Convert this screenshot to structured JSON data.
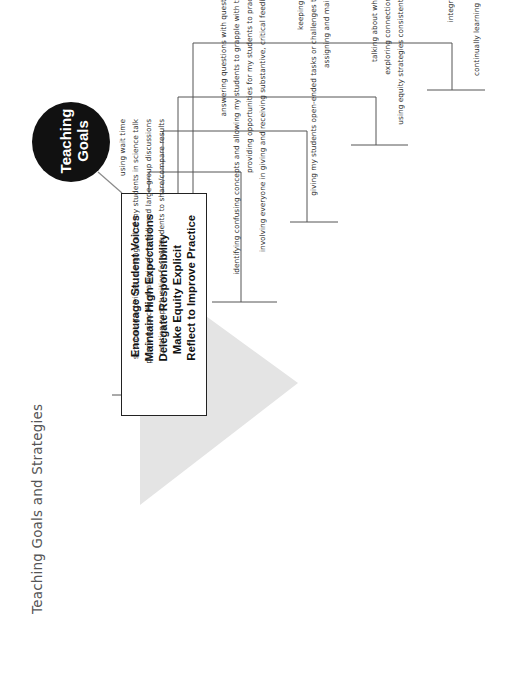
{
  "title": "Teaching Goals and Strategies",
  "center_node": {
    "line1": "Teaching",
    "line2": "Goals"
  },
  "goals": [
    {
      "label": "Encourage Student Voices",
      "strategies": [
        "using wait time",
        "structuring activities to engage all of my students in science talk",
        "planning specific strategies for small- and large-group discussions",
        "creating opportunities for my students to share/compare results"
      ]
    },
    {
      "label": "Maintain High Expectations",
      "strategies": [
        "answering questions with questions",
        "identifying confusing concepts and allowing my students to grapple with them",
        "providing opportunities for my students to practice",
        "involving everyone in giving and receiving substantive, critical feedback"
      ]
    },
    {
      "label": "Delegate Responsibility",
      "strategies": [
        "keeping my hands in my pockets",
        "giving my students open-ended tasks or challenges that have many solutions",
        "assigning and maintaining procedural roles"
      ]
    },
    {
      "label": "Make Equity Explicit",
      "strategies": [
        "learning to see inequity",
        "talking about what equity means and looks like",
        "exploring connections between beliefs and actions",
        "using equity strategies consistently and discussing them openly"
      ]
    },
    {
      "label": "Reflect to Improve Practice",
      "strategies": [
        "reflecting on the equity climate in my classroom",
        "integrating equity considerations into my lesson planning",
        "collecting and analyzing classroom evidence",
        "continually learning new things and using them to improve my teaching"
      ]
    }
  ],
  "colors": {
    "circle": "#111111",
    "connector": "#5a5a5a",
    "arrow_shade": "#e3e3e3",
    "text": "#333333"
  }
}
